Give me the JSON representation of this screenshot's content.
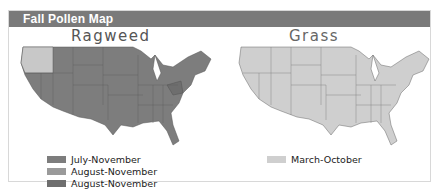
{
  "header": {
    "title": "Fall Pollen Map"
  },
  "colors": {
    "header_bg": "#7a7a7a",
    "ragweed_july_november": "#7d7d7d",
    "ragweed_august_november_light": "#9a9a9a",
    "ragweed_august_november_dark": "#6e6e6e",
    "grass_march_october": "#cfcfcf",
    "pacific_nw_light": "#c8c8c8"
  },
  "maps": [
    {
      "title": "Ragweed",
      "legend": [
        {
          "label": "July-November",
          "color": "#7d7d7d"
        },
        {
          "label": "August-November",
          "color": "#9a9a9a"
        },
        {
          "label": "August-November",
          "color": "#6e6e6e"
        }
      ]
    },
    {
      "title": "Grass",
      "legend": [
        {
          "label": "March-October",
          "color": "#cfcfcf"
        }
      ]
    }
  ]
}
